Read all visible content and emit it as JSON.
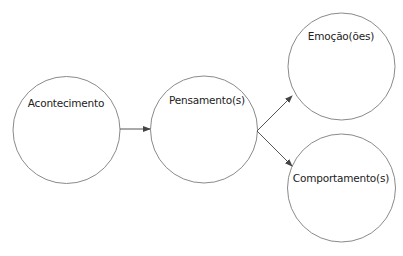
{
  "diagram": {
    "type": "flow",
    "colors": {
      "stroke": "#8a8a8a",
      "arrow": "#444444",
      "text": "#222222",
      "background": "#ffffff"
    },
    "nodes": [
      {
        "id": "acontecimento",
        "label": "Acontecimento"
      },
      {
        "id": "pensamento",
        "label": "Pensamento(s)"
      },
      {
        "id": "emocao",
        "label": "Emoção(ões)"
      },
      {
        "id": "comportamento",
        "label": "Comportamento(s)"
      }
    ],
    "edges": [
      {
        "from": "acontecimento",
        "to": "pensamento"
      },
      {
        "from": "pensamento",
        "to": "emocao"
      },
      {
        "from": "pensamento",
        "to": "comportamento"
      }
    ]
  }
}
